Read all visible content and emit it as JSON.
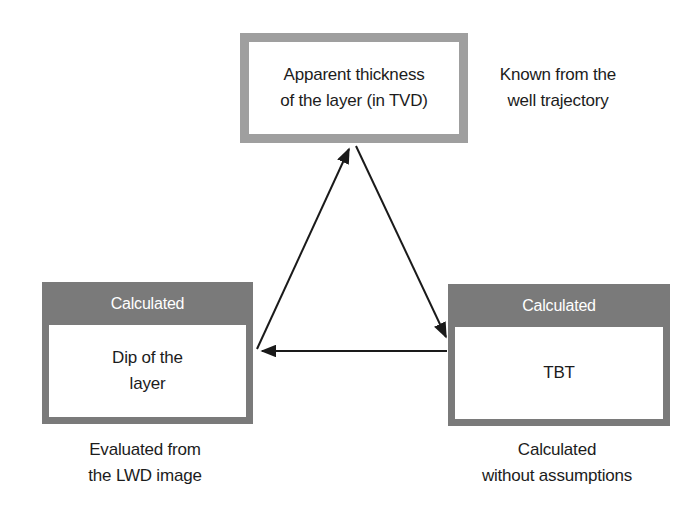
{
  "figure": {
    "background": "#ffffff",
    "text_color": "#1c1c1c",
    "boxes": {
      "top": {
        "label_line1": "Apparent thickness",
        "label_line2": "of the layer (in TVD)",
        "border_color": "#9f9f9f",
        "fill": "#ffffff"
      },
      "left": {
        "header": "Calculated",
        "header_text_color": "#ffffff",
        "label_line1": "Dip of the",
        "label_line2": "layer",
        "frame_color": "#7a7a7a",
        "fill": "#ffffff"
      },
      "right": {
        "header": "Calculated",
        "header_text_color": "#ffffff",
        "label": "TBT",
        "frame_color": "#7a7a7a",
        "fill": "#ffffff"
      }
    },
    "annotations": {
      "top_right": {
        "line1": "Known from the",
        "line2": "well trajectory"
      },
      "bottom_left": {
        "line1": "Evaluated from",
        "line2": "the LWD image"
      },
      "bottom_right": {
        "line1": "Calculated",
        "line2": "without assumptions"
      }
    },
    "arrows": {
      "color": "#1a1a1a",
      "relations": [
        {
          "from": "Dip of the layer",
          "to": "Apparent thickness of the layer (in TVD)"
        },
        {
          "from": "Apparent thickness of the layer (in TVD)",
          "to": "TBT"
        },
        {
          "from": "TBT",
          "to": "Dip of the layer"
        }
      ]
    }
  }
}
